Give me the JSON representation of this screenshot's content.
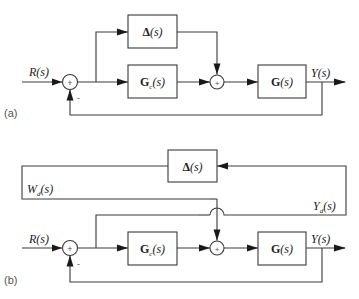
{
  "diagram_a": {
    "panel_label": "(a)",
    "input_label": "R(s)",
    "output_label": "Y(s)",
    "sum1_sign": "+",
    "sum1_feedback_sign": "-",
    "sum2_sign": "+",
    "blocks": {
      "delta": {
        "bold": "Δ",
        "rest": "(s)"
      },
      "controller": {
        "bold": "G",
        "sub": "c",
        "rest": "(s)"
      },
      "plant": {
        "bold": "G",
        "rest": "(s)"
      }
    }
  },
  "diagram_b": {
    "panel_label": "(b)",
    "input_label": "R(s)",
    "output_label": "Y(s)",
    "sum1_sign": "+",
    "sum1_feedback_sign": "-",
    "sum2_sign": "+",
    "wd_label": {
      "main": "W",
      "sub": "d",
      "rest": "(s)"
    },
    "yd_label": {
      "main": "Y",
      "sub": "d",
      "rest": "(s)"
    },
    "blocks": {
      "delta": {
        "bold": "Δ",
        "rest": "(s)"
      },
      "controller": {
        "bold": "G",
        "sub": "c",
        "rest": "(s)"
      },
      "plant": {
        "bold": "G",
        "rest": "(s)"
      }
    }
  }
}
